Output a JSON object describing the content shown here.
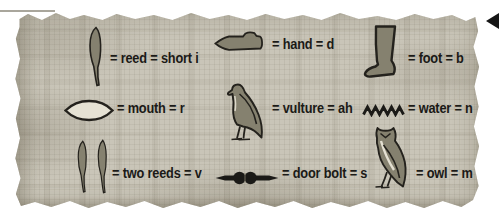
{
  "figure": {
    "kind": "hieroglyph-key",
    "palette": {
      "papyrus": "#c9c5b8",
      "ink": "#1b1a17",
      "glyph_fill": "#85816f",
      "glyph_outline": "#24221d",
      "mouth_fill": "#e6e2d4",
      "marker": "#161616"
    },
    "marker_icon": "left-arrowhead-icon"
  },
  "entries": [
    {
      "glyph_icon": "reed-icon",
      "label": "= reed = short i"
    },
    {
      "glyph_icon": "hand-icon",
      "label": "= hand = d"
    },
    {
      "glyph_icon": "foot-icon",
      "label": "= foot = b"
    },
    {
      "glyph_icon": "mouth-icon",
      "label": "= mouth = r"
    },
    {
      "glyph_icon": "vulture-icon",
      "label": "= vulture = ah"
    },
    {
      "glyph_icon": "water-icon",
      "label": "= water = n"
    },
    {
      "glyph_icon": "two-reeds-icon",
      "label": "= two reeds = v"
    },
    {
      "glyph_icon": "door-bolt-icon",
      "label": "= door bolt = s"
    },
    {
      "glyph_icon": "owl-icon",
      "label": "= owl = m"
    }
  ]
}
